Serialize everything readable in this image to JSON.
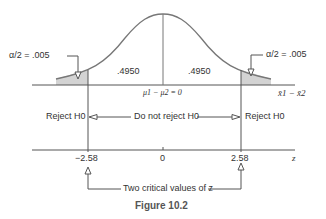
{
  "figure": {
    "caption": "Figure 10.2",
    "left_tail_label": "α/2 = .005",
    "right_tail_label": "α/2 = .005",
    "left_area": ".4950",
    "right_area": ".4950",
    "mean_label_prefix": "μ",
    "mean_label": "μ1 − μ2 = 0",
    "x_axis_label": "x̄1 − x̄2",
    "reject_left": "Reject H0",
    "do_not_reject": "Do not reject H0",
    "reject_right": "Reject H0",
    "z_axis_label": "z",
    "z_ticks": [
      "−2.58",
      "0",
      "2.58"
    ],
    "critical_note": "Two critical values of z",
    "colors": {
      "line": "#555555",
      "shade": "#d3d3d3",
      "text": "#333333"
    }
  }
}
